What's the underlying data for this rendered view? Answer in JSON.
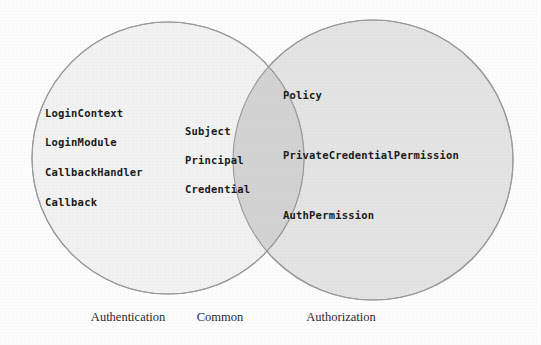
{
  "diagram": {
    "type": "venn",
    "title": "",
    "background_color": "#fdfdfd",
    "sets": [
      {
        "id": "authentication",
        "caption": "Authentication",
        "fill_color": "#f2f2f2",
        "stroke_color": "#9a9a9a",
        "caption_x": 128,
        "caption_y": 310,
        "circle": {
          "cx": 168,
          "cy": 158,
          "r": 136
        },
        "members": [
          {
            "label": "LoginContext",
            "x": 45,
            "y": 107
          },
          {
            "label": "LoginModule",
            "x": 45,
            "y": 136
          },
          {
            "label": "CallbackHandler",
            "x": 45,
            "y": 166
          },
          {
            "label": "Callback",
            "x": 45,
            "y": 196
          }
        ]
      },
      {
        "id": "common",
        "caption": "Common",
        "fill_color": "#d3d3d3",
        "stroke_color": "#9a9a9a",
        "caption_x": 220,
        "caption_y": 310,
        "members": [
          {
            "label": "Subject",
            "x": 185,
            "y": 125
          },
          {
            "label": "Principal",
            "x": 185,
            "y": 154
          },
          {
            "label": "Credential",
            "x": 185,
            "y": 183
          }
        ]
      },
      {
        "id": "authorization",
        "caption": "Authorization",
        "fill_color": "#e4e4e4",
        "stroke_color": "#9a9a9a",
        "caption_x": 341,
        "caption_y": 310,
        "circle": {
          "cx": 373,
          "cy": 160,
          "r": 140
        },
        "members": [
          {
            "label": "Policy",
            "x": 283,
            "y": 89
          },
          {
            "label": "PrivateCredentialPermission",
            "x": 283,
            "y": 149
          },
          {
            "label": "AuthPermission",
            "x": 283,
            "y": 209
          }
        ]
      }
    ]
  }
}
